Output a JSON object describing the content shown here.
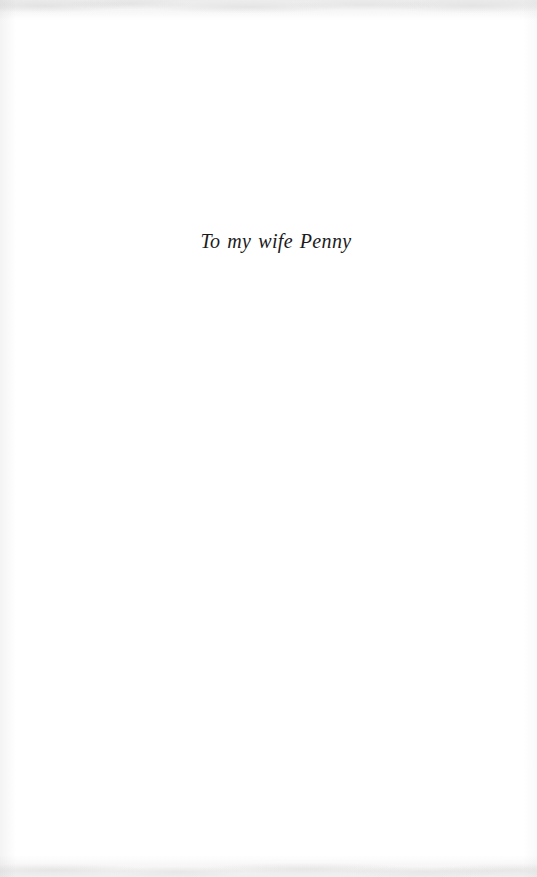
{
  "page": {
    "kind": "book-dedication-page",
    "background_color": "#ffffff",
    "width": 537,
    "height": 877
  },
  "dedication": {
    "text": "To my wife Penny",
    "style": "italic-serif",
    "text_color": "#1b1b1d",
    "alignment": "center"
  },
  "scan_artifacts": {
    "top_edge_tone": "#8c8c8f",
    "bottom_edge_tone": "#8c8c8f",
    "left_edge_tone": "#8c8c8f"
  }
}
